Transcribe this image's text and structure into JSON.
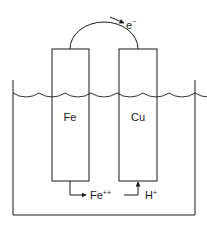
{
  "diagram": {
    "type": "galvanic-corrosion-cell",
    "electron_label": "e",
    "electron_charge": "−",
    "electrodes": [
      {
        "label": "Fe",
        "role": "anode"
      },
      {
        "label": "Cu",
        "role": "cathode"
      }
    ],
    "ions": [
      {
        "symbol": "Fe",
        "charge": "++",
        "direction": "out-of-electrode"
      },
      {
        "symbol": "H",
        "charge": "+",
        "direction": "into-electrode"
      }
    ],
    "colors": {
      "line": "#1a1a1a",
      "background": "#ffffff"
    }
  }
}
